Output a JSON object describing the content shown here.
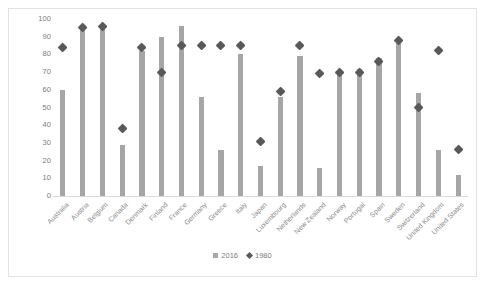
{
  "chart_data": {
    "type": "bar",
    "title": "",
    "xlabel": "",
    "ylabel": "",
    "ylim": [
      0,
      100
    ],
    "yticks": [
      0,
      10,
      20,
      30,
      40,
      50,
      60,
      70,
      80,
      90,
      100
    ],
    "grid": false,
    "legend_position": "bottom",
    "categories": [
      "Australia",
      "Austria",
      "Belgium",
      "Canada",
      "Denmark",
      "Finland",
      "France",
      "Germany",
      "Greece",
      "Italy",
      "Japan",
      "Luxembourg",
      "Netherlands",
      "New Zealand",
      "Norway",
      "Portugal",
      "Spain",
      "Sweden",
      "Switzerland",
      "United Kingdom",
      "United States"
    ],
    "series": [
      {
        "name": "2016",
        "marker": "bar",
        "color": "#a6a6a6",
        "values": [
          60,
          95,
          96,
          29,
          82,
          90,
          96,
          56,
          26,
          80,
          17,
          56,
          79,
          16,
          70,
          72,
          78,
          89,
          58,
          26,
          12
        ]
      },
      {
        "name": "1980",
        "marker": "diamond",
        "color": "#595959",
        "values": [
          84,
          95,
          96,
          38,
          84,
          70,
          85,
          85,
          85,
          85,
          31,
          59,
          85,
          69,
          70,
          70,
          76,
          88,
          50,
          82,
          26
        ]
      }
    ]
  },
  "legend": {
    "items": [
      {
        "label": "2016",
        "marker": "square-marker"
      },
      {
        "label": "1980",
        "marker": "diamond-marker"
      }
    ]
  },
  "colors": {
    "bar": "#a6a6a6",
    "diamond": "#595959",
    "axis_text": "#7c7c7c",
    "category_text": "#8a8a8a",
    "frame_border": "#e2e2e2",
    "baseline": "#d9d9d9"
  }
}
